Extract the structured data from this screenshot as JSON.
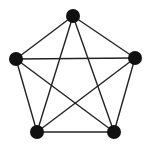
{
  "diagram": {
    "type": "complete-graph",
    "name": "K5",
    "width": 151,
    "height": 146,
    "background": "#ffffff",
    "node_color": "#111111",
    "edge_color": "#222222",
    "node_radius": 7,
    "edge_width": 1.4,
    "nodes": [
      {
        "id": "top",
        "x": 73,
        "y": 16
      },
      {
        "id": "left",
        "x": 16,
        "y": 59
      },
      {
        "id": "right",
        "x": 135,
        "y": 58
      },
      {
        "id": "bottom-left",
        "x": 37,
        "y": 132
      },
      {
        "id": "bottom-right",
        "x": 114,
        "y": 132
      }
    ],
    "edges": [
      [
        "top",
        "left"
      ],
      [
        "top",
        "right"
      ],
      [
        "top",
        "bottom-left"
      ],
      [
        "top",
        "bottom-right"
      ],
      [
        "left",
        "right"
      ],
      [
        "left",
        "bottom-left"
      ],
      [
        "left",
        "bottom-right"
      ],
      [
        "right",
        "bottom-left"
      ],
      [
        "right",
        "bottom-right"
      ],
      [
        "bottom-left",
        "bottom-right"
      ]
    ]
  }
}
